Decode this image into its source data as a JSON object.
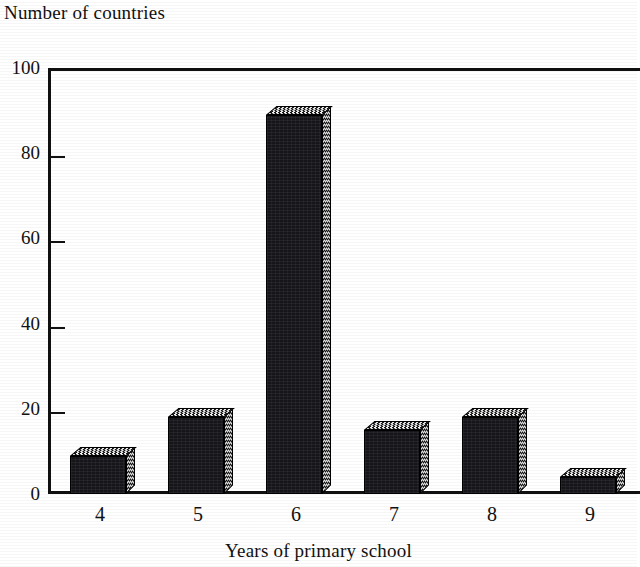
{
  "chart_data": {
    "type": "bar",
    "title": "Number of countries",
    "xlabel": "Years of primary school",
    "ylabel": "Number of countries",
    "categories": [
      "4",
      "5",
      "6",
      "7",
      "8",
      "9"
    ],
    "values": [
      9,
      18,
      89,
      15,
      18,
      4
    ],
    "series": [
      {
        "name": "Number of countries",
        "values": [
          9,
          18,
          89,
          15,
          18,
          4
        ]
      }
    ],
    "ylim": [
      0,
      100
    ],
    "ytick_labels": [
      "0",
      "20",
      "40",
      "60",
      "80",
      "100"
    ],
    "ytick_values": [
      0,
      20,
      40,
      60,
      80,
      100
    ],
    "xtick_labels": [
      "4",
      "5",
      "6",
      "7",
      "8",
      "9"
    ],
    "grid": false,
    "legend": false,
    "legend_position": "none",
    "bar_style": "3d-extruded",
    "colors": {
      "bar_face": "#16161a",
      "bar_highlight": "#111111",
      "axis": "#101010",
      "text": "#111111",
      "background": "#ffffff"
    }
  },
  "axis": {
    "y_title": "Number of countries",
    "x_title": "Years of primary school"
  }
}
